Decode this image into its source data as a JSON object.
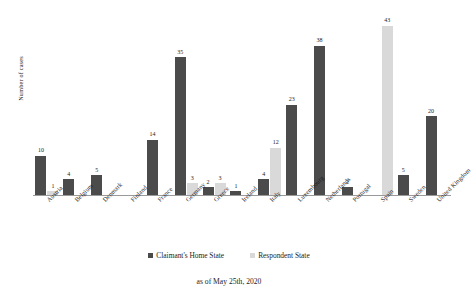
{
  "chart_data": {
    "type": "bar",
    "title": "",
    "subtitle": "",
    "xlabel": "",
    "ylabel": "Number of cases",
    "ylim": [
      0,
      45
    ],
    "grid": false,
    "legend_position": "bottom",
    "categories": [
      "Austria",
      "Belgium",
      "Denmark",
      "Finland",
      "France",
      "Germany",
      "Greece",
      "Ireland",
      "Italy",
      "Luxembourg",
      "Netherlands",
      "Portugal",
      "Spain",
      "Sweden",
      "United Kingdom"
    ],
    "series": [
      {
        "name": "Claimant's Home State",
        "color": "#4b4b4b",
        "values": [
          10,
          4,
          5,
          0,
          14,
          35,
          2,
          1,
          4,
          23,
          38,
          2,
          0,
          5,
          20
        ]
      },
      {
        "name": "Respondent State",
        "color": "#d9d9d9",
        "values": [
          1,
          0,
          0,
          0,
          0,
          3,
          3,
          0,
          12,
          0,
          0,
          0,
          43,
          0,
          0
        ]
      }
    ],
    "annotation": "as of May 25th, 2020"
  },
  "legend": {
    "items": [
      {
        "label": "Claimant's Home State"
      },
      {
        "label": "Respondent State"
      }
    ]
  },
  "footnote": {
    "text": "as of May 25th, 2020"
  },
  "axis": {
    "y_title": "Number of cases"
  }
}
